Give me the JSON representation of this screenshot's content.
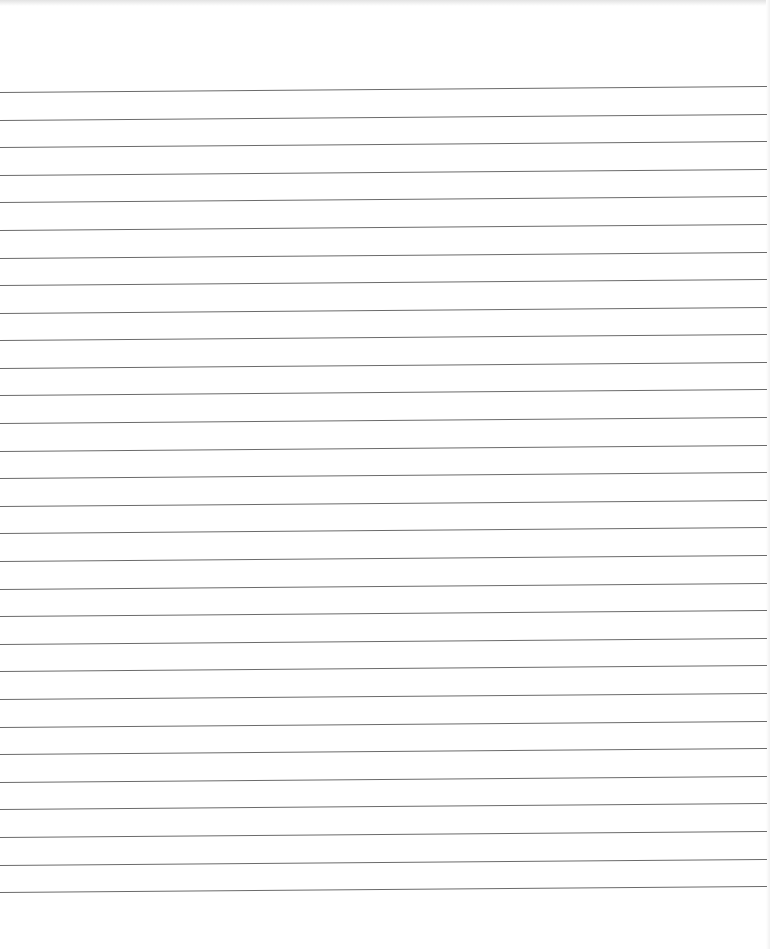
{
  "page": {
    "type": "lined-paper",
    "background_color": "#ffffff",
    "line_color": "#6a6a6a",
    "line_count": 30,
    "first_line_y": 92,
    "line_spacing": 27.59,
    "line_width": 767
  }
}
